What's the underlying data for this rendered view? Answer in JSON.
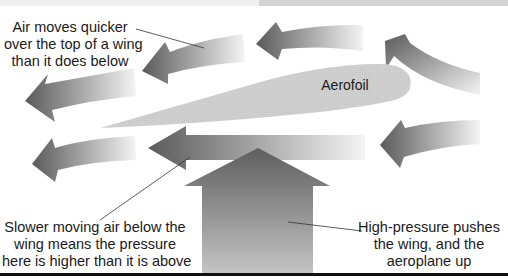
{
  "diagram": {
    "labels": {
      "aerofoil": "Aerofoil",
      "top_note": [
        "Air moves quicker",
        "over the top of a wing",
        "than it does below"
      ],
      "bottom_left_note": [
        "Slower moving air below the",
        "wing means the pressure",
        "here is higher than it is above"
      ],
      "bottom_right_note": [
        "High-pressure pushes",
        "the wing, and the",
        "aeroplane up"
      ]
    },
    "colors": {
      "arrow_dark": "#5a5a5a",
      "arrow_light": "#f2f2f2",
      "aerofoil_fill": "#cfcfcf",
      "text": "#1a1a1a",
      "rule": "#111111"
    },
    "elements": {
      "airflow_arrows_above": 4,
      "airflow_arrows_below": 3,
      "lift_arrow": "up"
    }
  }
}
